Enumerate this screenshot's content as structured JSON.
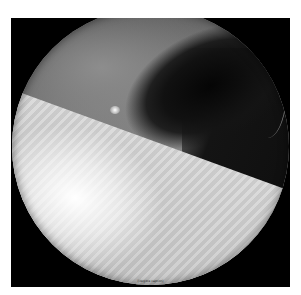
{
  "image": {
    "type": "arthroscopic-view",
    "description": "Circular grayscale endoscopic/arthroscopic view showing gray tissue above, a dark cavity to the upper right, and a bright striated instrument surface in the lower portion",
    "colors": {
      "frame": "#000000",
      "background": "#ffffff",
      "tissue": "#7c7c7c",
      "cavity": "#0d0d0d",
      "instrument": "#d8d8d8"
    }
  },
  "caption": {
    "text": "[illegible caption]"
  }
}
